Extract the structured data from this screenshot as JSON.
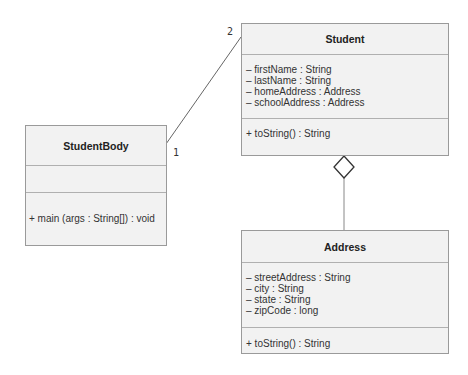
{
  "diagram": {
    "type": "UML class diagram",
    "classes": [
      {
        "id": "student",
        "name": "Student",
        "attributes": [
          "– firstName : String",
          "– lastName : String",
          "– homeAddress : Address",
          "– schoolAddress : Address"
        ],
        "methods": [
          "+ toString() : String"
        ]
      },
      {
        "id": "studentbody",
        "name": "StudentBody",
        "attributes": [],
        "methods": [
          "+ main (args : String[]) : void"
        ]
      },
      {
        "id": "address",
        "name": "Address",
        "attributes": [
          "– streetAddress : String",
          "– city : String",
          "– state : String",
          "– zipCode : long"
        ],
        "methods": [
          "+ toString() : String"
        ]
      }
    ],
    "relationships": [
      {
        "type": "association",
        "from": "StudentBody",
        "to": "Student",
        "from_multiplicity": "1",
        "to_multiplicity": "2"
      },
      {
        "type": "aggregation",
        "whole": "Student",
        "part": "Address",
        "symbol": "hollow-diamond"
      }
    ]
  },
  "colors": {
    "box_fill": "#f2f2f2",
    "box_border": "#9a9a9a",
    "line": "#555555",
    "text": "#333333"
  }
}
